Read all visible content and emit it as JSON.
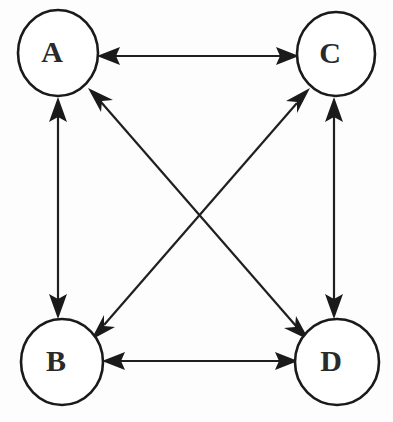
{
  "diagram": {
    "type": "node-link-graph",
    "graph_kind": "complete-directed-graph-K4",
    "background_color": "#fdfdfd",
    "stroke_color": "#1a1a1a",
    "node_fill_color": "#ffffff",
    "label_color": "#2a2a2a",
    "canvas": {
      "width": 393,
      "height": 422
    },
    "nodes": [
      {
        "id": "A",
        "label": "A",
        "cx": 58,
        "cy": 53,
        "rx": 40,
        "ry": 43,
        "position": "top-left"
      },
      {
        "id": "C",
        "label": "C",
        "cx": 336,
        "cy": 54,
        "rx": 39,
        "ry": 42,
        "position": "top-right"
      },
      {
        "id": "B",
        "label": "B",
        "cx": 62,
        "cy": 362,
        "rx": 41,
        "ry": 43,
        "position": "bottom-left"
      },
      {
        "id": "D",
        "label": "D",
        "cx": 337,
        "cy": 362,
        "rx": 42,
        "ry": 43,
        "position": "bottom-right"
      }
    ],
    "edges": [
      {
        "id": "edge-a-c",
        "from": "A",
        "to": "C",
        "direction": "bidirectional",
        "label": "A <-> C",
        "kind": "horizontal-top"
      },
      {
        "id": "edge-b-d",
        "from": "B",
        "to": "D",
        "direction": "bidirectional",
        "label": "B <-> D",
        "kind": "horizontal-bottom"
      },
      {
        "id": "edge-a-b",
        "from": "A",
        "to": "B",
        "direction": "bidirectional",
        "label": "A <-> B",
        "kind": "vertical-left"
      },
      {
        "id": "edge-c-d",
        "from": "C",
        "to": "D",
        "direction": "bidirectional",
        "label": "C <-> D",
        "kind": "vertical-right"
      },
      {
        "id": "edge-a-d",
        "from": "A",
        "to": "D",
        "direction": "bidirectional",
        "label": "A <-> D",
        "kind": "diagonal"
      },
      {
        "id": "edge-b-c",
        "from": "B",
        "to": "C",
        "direction": "bidirectional",
        "label": "B <-> C",
        "kind": "diagonal"
      }
    ],
    "edge_count": 6,
    "node_count": 4
  }
}
